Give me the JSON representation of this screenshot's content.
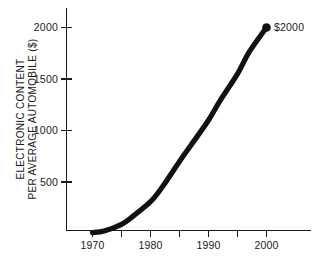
{
  "chart_data": {
    "type": "line",
    "title": "",
    "subtitle": "",
    "xlabel": "",
    "ylabel_line1": "ELECTRONIC CONTENT",
    "ylabel_line2": "PER AVERAGE AUTOMOBILE ($)",
    "x": [
      1970,
      1972,
      1975,
      1977,
      1980,
      1982,
      1985,
      1987,
      1990,
      1992,
      1995,
      1997,
      2000
    ],
    "values": [
      10,
      25,
      90,
      170,
      310,
      450,
      700,
      860,
      1100,
      1290,
      1550,
      1760,
      2000
    ],
    "series": [
      {
        "name": "Electronic content per average automobile",
        "values": [
          10,
          25,
          90,
          170,
          310,
          450,
          700,
          860,
          1100,
          1290,
          1550,
          1760,
          2000
        ]
      }
    ],
    "xlim": [
      1968,
      2004
    ],
    "ylim": [
      0,
      2150
    ],
    "xticks_major": [
      1970,
      1980,
      1990,
      2000
    ],
    "xticks_minor": [
      1975,
      1985,
      1995
    ],
    "xtick_labels": [
      "1970",
      "1980",
      "1990",
      "2000"
    ],
    "yticks": [
      500,
      1000,
      1500,
      2000
    ],
    "ytick_labels": [
      "500",
      "1000",
      "1500",
      "2000"
    ],
    "grid": false,
    "legend": false,
    "legend_position": "none",
    "annotations": [
      {
        "label": "$2000",
        "x": 2000,
        "y": 2000,
        "marker": "filled-circle"
      }
    ],
    "colors": {
      "curve": "#111111",
      "axis": "#1a1a1a",
      "text": "#1a1a1a",
      "background": "#ffffff",
      "marker": "#111111"
    }
  }
}
